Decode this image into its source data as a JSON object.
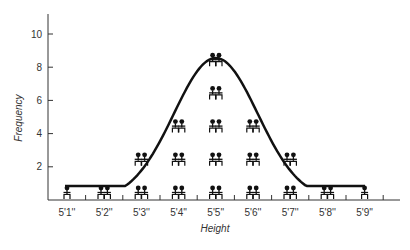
{
  "chart_data": {
    "type": "bar",
    "title": "",
    "xlabel": "Height",
    "ylabel": "Frequency",
    "categories": [
      "5'1''",
      "5'2''",
      "5'3''",
      "5'4''",
      "5'5''",
      "5'6''",
      "5'7''",
      "5'8''",
      "5'9''"
    ],
    "values": [
      1,
      2,
      4,
      6,
      10,
      6,
      4,
      2,
      1
    ],
    "y_ticks": [
      2,
      4,
      6,
      8,
      10
    ],
    "ylim": [
      0,
      11
    ],
    "grid": false,
    "legend": null,
    "marks": "pictogram figures (pair of people = 2, single person = 1)",
    "overlay": "smooth normal-distribution curve"
  },
  "colors": {
    "ink": "#111111",
    "axis": "#333333"
  }
}
